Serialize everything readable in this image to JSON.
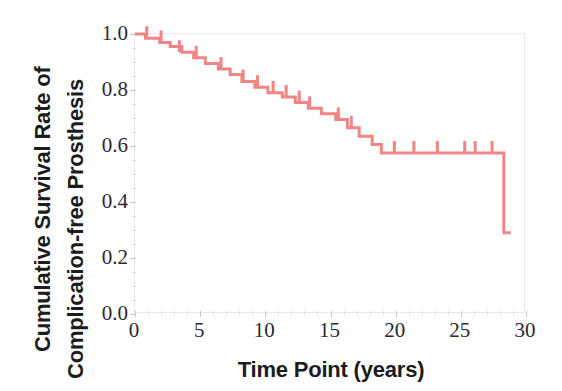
{
  "chart_data": {
    "type": "line",
    "subtype": "kaplan-meier-step",
    "title": "",
    "xlabel": "Time Point (years)",
    "ylabel_line_1": "Cumulative Survival Rate of",
    "ylabel_line_2": "Complication-free Prosthesis",
    "ylabel": "Cumulative Survival Rate of Complication-free Prosthesis",
    "xlim": [
      0,
      30
    ],
    "ylim": [
      0.0,
      1.0
    ],
    "grid": false,
    "legend": null,
    "legend_position": "none",
    "line_color": "#F08585",
    "line_width": 3,
    "x_ticks": [
      0,
      5,
      10,
      15,
      20,
      25,
      30
    ],
    "x_tick_labels": [
      "0",
      "5",
      "10",
      "15",
      "20",
      "25",
      "30"
    ],
    "x_minor_ticks": [
      1,
      2,
      3,
      4,
      6,
      7,
      8,
      9,
      11,
      12,
      13,
      14,
      16,
      17,
      18,
      19,
      21,
      22,
      23,
      24,
      26,
      27,
      28,
      29
    ],
    "y_ticks": [
      0.0,
      0.2,
      0.4,
      0.6,
      0.8,
      1.0
    ],
    "y_tick_labels": [
      "0.0",
      "0.2",
      "0.4",
      "0.6",
      "0.8",
      "1.0"
    ],
    "y_minor_ticks": [
      0.05,
      0.1,
      0.15,
      0.25,
      0.3,
      0.35,
      0.45,
      0.5,
      0.55,
      0.65,
      0.7,
      0.75,
      0.85,
      0.9,
      0.95
    ],
    "series": [
      {
        "name": "Complication-free prosthesis survival",
        "x": [
          0.0,
          0.8,
          1.9,
          2.7,
          3.6,
          4.5,
          5.4,
          6.4,
          7.3,
          8.2,
          9.2,
          10.2,
          11.3,
          12.3,
          13.3,
          14.3,
          15.4,
          16.3,
          17.2,
          18.2,
          18.9,
          27.4,
          28.3
        ],
        "values": [
          1.0,
          0.985,
          0.97,
          0.955,
          0.935,
          0.915,
          0.895,
          0.875,
          0.855,
          0.83,
          0.81,
          0.79,
          0.775,
          0.755,
          0.735,
          0.715,
          0.695,
          0.665,
          0.635,
          0.605,
          0.575,
          0.575,
          0.29
        ]
      }
    ],
    "censoring_marks": {
      "description": "short vertical tick marks above the step line indicating censored observations",
      "x": [
        0.9,
        2.0,
        3.4,
        4.7,
        6.6,
        8.3,
        9.4,
        10.6,
        11.6,
        12.6,
        13.4,
        15.6,
        16.6,
        19.9,
        21.4,
        23.2,
        25.3,
        26.1,
        27.4
      ],
      "y": [
        0.985,
        0.97,
        0.935,
        0.915,
        0.875,
        0.83,
        0.81,
        0.79,
        0.775,
        0.755,
        0.735,
        0.695,
        0.665,
        0.575,
        0.575,
        0.575,
        0.575,
        0.575,
        0.575
      ]
    },
    "annotations": []
  }
}
